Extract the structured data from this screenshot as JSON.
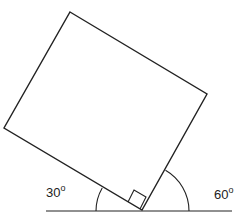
{
  "diagram": {
    "type": "geometry",
    "stroke_color": "#222222",
    "background": "#ffffff",
    "labels": {
      "left_angle_value": "30",
      "left_angle_unit": "o",
      "right_angle_value": "60",
      "right_angle_unit": "o"
    },
    "shapes": {
      "square_vertices": [
        [
          70,
          12
        ],
        [
          207,
          94
        ],
        [
          142,
          210
        ],
        [
          4,
          128
        ]
      ],
      "baseline": {
        "x1": 46,
        "y1": 211,
        "x2": 232,
        "y2": 211
      },
      "right_angle_marker": [
        [
          128,
          202
        ],
        [
          134,
          190
        ],
        [
          146,
          197
        ],
        [
          140,
          209
        ]
      ],
      "left_arc": {
        "cx": 142,
        "cy": 211,
        "r": 46,
        "angle_deg": 30
      },
      "right_arc": {
        "cx": 142,
        "cy": 211,
        "r": 47,
        "angle_deg": 60
      }
    }
  }
}
